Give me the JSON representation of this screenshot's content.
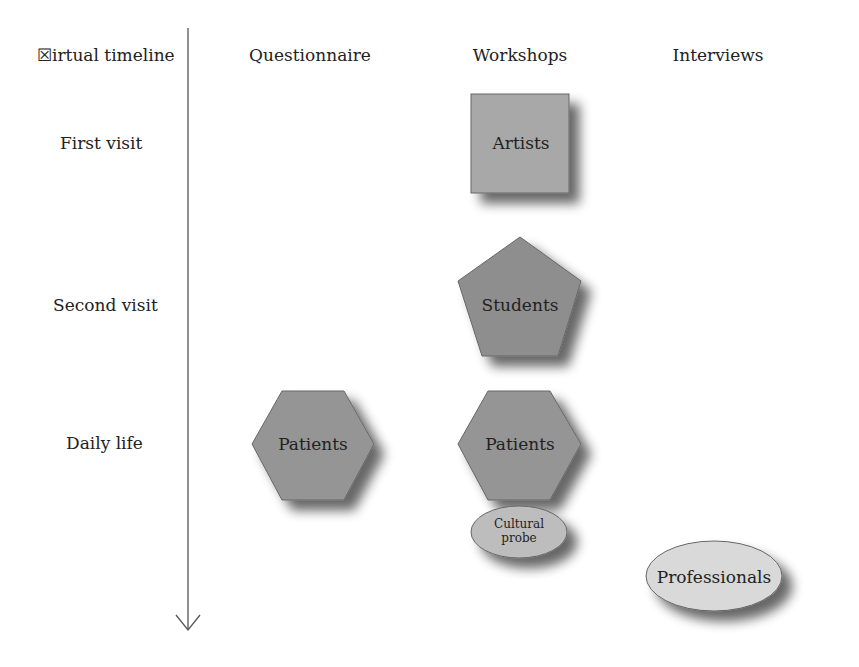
{
  "axis": {
    "label": "☒irtual timeline",
    "rows": [
      {
        "label": "First visit"
      },
      {
        "label": "Second visit"
      },
      {
        "label": "Daily life"
      }
    ]
  },
  "columns": [
    {
      "label": "Questionnaire"
    },
    {
      "label": "Workshops"
    },
    {
      "label": "Interviews"
    }
  ],
  "nodes": {
    "artists": {
      "label": "Artists",
      "shape": "square",
      "color": "#a8a8a8"
    },
    "students": {
      "label": "Students",
      "shape": "pentagon",
      "color": "#8e8e8e"
    },
    "patients_questionnaire": {
      "label": "Patients",
      "shape": "hexagon",
      "color": "#959595"
    },
    "patients_workshops": {
      "label": "Patients",
      "shape": "hexagon",
      "color": "#959595"
    },
    "cultural_probe": {
      "label_line1": "Cultural",
      "label_line2": "probe",
      "shape": "ellipse",
      "color": "#bdbdbd"
    },
    "professionals": {
      "label": "Professionals",
      "shape": "ellipse",
      "color": "#d9d9d9"
    }
  }
}
